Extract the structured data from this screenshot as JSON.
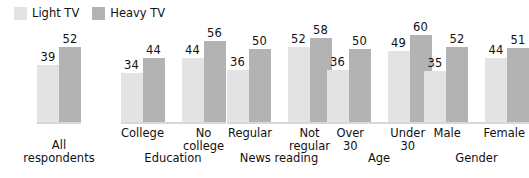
{
  "legend": {
    "entries": [
      {
        "label": "Light TV",
        "color": "#e3e3e3",
        "key": "light"
      },
      {
        "label": "Heavy TV",
        "color": "#b3b3b3",
        "key": "heavy"
      }
    ]
  },
  "chart_data": {
    "type": "bar",
    "title": "",
    "subtitle": "",
    "xlabel": "",
    "ylabel": "",
    "ylim": [
      0,
      60
    ],
    "grid": false,
    "legend_position": "top-left",
    "series": [
      {
        "name": "Light TV",
        "color": "#e3e3e3",
        "values": [
          39,
          34,
          44,
          36,
          52,
          36,
          49,
          35,
          44
        ]
      },
      {
        "name": "Heavy TV",
        "color": "#b3b3b3",
        "values": [
          52,
          44,
          56,
          50,
          58,
          50,
          60,
          52,
          51
        ]
      }
    ],
    "categories": [
      "",
      "College",
      "No college",
      "Regular",
      "Not regular",
      "Over 30",
      "Under 30",
      "Male",
      "Female"
    ],
    "groups": [
      {
        "group_label_line1": "All",
        "group_label_line2": "respondents",
        "bars": [
          {
            "category_line1": "",
            "category_line2": "",
            "light": 39,
            "heavy": 52
          }
        ]
      },
      {
        "group_label_line1": "Education",
        "group_label_line2": "",
        "bars": [
          {
            "category_line1": "College",
            "category_line2": "",
            "light": 34,
            "heavy": 44
          },
          {
            "category_line1": "No",
            "category_line2": "college",
            "light": 44,
            "heavy": 56
          }
        ]
      },
      {
        "group_label_line1": "News reading",
        "group_label_line2": "",
        "bars": [
          {
            "category_line1": "Regular",
            "category_line2": "",
            "light": 36,
            "heavy": 50
          },
          {
            "category_line1": "Not",
            "category_line2": "regular",
            "light": 52,
            "heavy": 58
          }
        ]
      },
      {
        "group_label_line1": "Age",
        "group_label_line2": "",
        "bars": [
          {
            "category_line1": "Over",
            "category_line2": "30",
            "light": 36,
            "heavy": 50
          },
          {
            "category_line1": "Under",
            "category_line2": "30",
            "light": 49,
            "heavy": 60
          }
        ]
      },
      {
        "group_label_line1": "Gender",
        "group_label_line2": "",
        "bars": [
          {
            "category_line1": "Male",
            "category_line2": "",
            "light": 35,
            "heavy": 52
          },
          {
            "category_line1": "Female",
            "category_line2": "",
            "light": 44,
            "heavy": 51
          }
        ]
      }
    ]
  },
  "layout": {
    "baseline_y": 122,
    "px_per_unit": 1.45,
    "group_x": [
      0,
      118,
      228,
      330,
      428
    ],
    "group_w": [
      118,
      110,
      102,
      98,
      97
    ]
  }
}
